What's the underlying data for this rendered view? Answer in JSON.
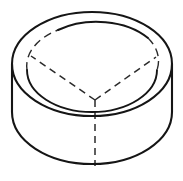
{
  "figure": {
    "kind": "technical-line-drawing",
    "background_color": "#ffffff",
    "visible_line_color": "#151515",
    "hidden_line_color": "#2a2a2a",
    "visible_line_width": 2.1,
    "hidden_line_width": 1.5,
    "hidden_line_dash": "7 5",
    "caption": "",
    "geometry": {
      "top_ellipse": {
        "center_x": 92,
        "center_y": 64,
        "radius_x": 80,
        "radius_y": 52
      },
      "bottom_ellipse": {
        "center_x": 92,
        "center_y": 112,
        "radius_x": 80,
        "radius_y": 52
      },
      "rim_ellipse": {
        "center_x": 92,
        "center_y": 70,
        "radius_x": 65,
        "radius_y": 42
      },
      "wall_height": 48,
      "partition_center_x": 95,
      "partition_center_y": 100,
      "partition_arm_left_x": 31,
      "partition_arm_left_y": 56,
      "partition_arm_right_x": 156,
      "partition_arm_right_y": 57,
      "partition_stem_bottom_y": 166
    },
    "paths": {
      "outer_silhouette": "M 12,64 A 80,52 0 0,1 172,64 L 172,112 A 80,52 0 0,1 12,112 Z",
      "top_ellipse_outline": "M 12,64 A 80,52 0 1,1 172,64 A 80,52 0 1,1 12,64",
      "bottom_ellipse_front_arc": "M 12,112 A 80,52 0 0,0 172,112",
      "left_wall": "M 12,64 L 12,112",
      "right_wall": "M 172,64 L 172,112",
      "rim_arc_top": "M 58,30 A 65,42 0 0,1 148,38",
      "rim_arc_left": "M 27,70 A 65,42 0 0,1 58,30",
      "rim_arc_right": "M 148,38 A 65,42 0 0,1 157,70",
      "rim_arc_front": "M 27,70 A 65,42 0 0,0 157,70",
      "partition_arm_left": "M 95,100 L 31,56",
      "partition_arm_right": "M 95,100 L 156,57",
      "partition_stem": "M 95,100 L 95,166"
    }
  }
}
